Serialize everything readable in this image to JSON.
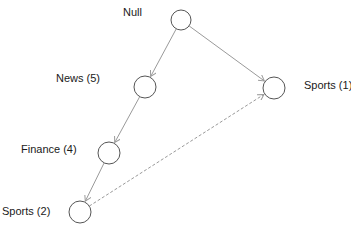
{
  "diagram": {
    "nodes": [
      {
        "id": "null",
        "label": "Null",
        "cx": 181,
        "cy": 20,
        "r": 10,
        "label_x": 123,
        "label_y": 6
      },
      {
        "id": "news",
        "label": "News (5)",
        "cx": 145,
        "cy": 87,
        "r": 11,
        "label_x": 56,
        "label_y": 72
      },
      {
        "id": "sports1",
        "label": "Sports (1)",
        "cx": 274,
        "cy": 88,
        "r": 11,
        "label_x": 304,
        "label_y": 79
      },
      {
        "id": "finance",
        "label": "Finance (4)",
        "cx": 109,
        "cy": 153,
        "r": 11,
        "label_x": 21,
        "label_y": 143
      },
      {
        "id": "sports2",
        "label": "Sports (2)",
        "cx": 80,
        "cy": 212,
        "r": 11,
        "label_x": 2,
        "label_y": 205
      }
    ],
    "edges": [
      {
        "from": "null",
        "to": "news",
        "style": "solid"
      },
      {
        "from": "null",
        "to": "sports1",
        "style": "solid"
      },
      {
        "from": "news",
        "to": "finance",
        "style": "solid"
      },
      {
        "from": "finance",
        "to": "sports2",
        "style": "solid"
      },
      {
        "from": "sports2",
        "to": "sports1",
        "style": "dashed"
      }
    ],
    "colors": {
      "node_stroke": "#555555",
      "edge": "#9a9a9a",
      "text": "#1a1a1a"
    }
  }
}
